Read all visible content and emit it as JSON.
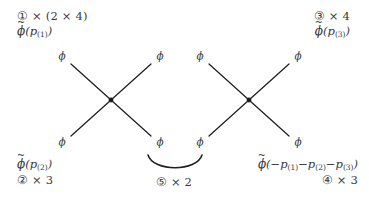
{
  "figure": {
    "background_color": "#ffffff",
    "ink_color": "#2b2b2b",
    "line_color": "#1e1e1e"
  },
  "annotations": {
    "top_left": {
      "factor": "① × (2 × 4)",
      "field_phi": "ϕ",
      "field_tilde": "~",
      "field_arg_open": "(",
      "field_momentum": "p",
      "field_subscript": "(1)",
      "field_arg_close": ")"
    },
    "top_right": {
      "factor": "③ × 4",
      "field_phi": "ϕ",
      "field_tilde": "~",
      "field_arg_open": "(",
      "field_momentum": "p",
      "field_subscript": "(3)",
      "field_arg_close": ")"
    },
    "bottom_left": {
      "factor": "② × 3",
      "field_phi": "ϕ",
      "field_tilde": "~",
      "field_arg_open": "(",
      "field_momentum": "p",
      "field_subscript": "(2)",
      "field_arg_close": ")"
    },
    "bottom_right": {
      "factor": "④ × 3",
      "field_phi": "ϕ",
      "field_tilde": "~",
      "field_arg_open": "(",
      "field_argument": "−p",
      "field_sub_1": "(1)",
      "field_op_1": "−",
      "field_mom_2": "p",
      "field_sub_2": "(2)",
      "field_op_2": "−",
      "field_mom_3": "p",
      "field_sub_3": "(3)",
      "field_arg_close": ")"
    },
    "center": {
      "factor": "⑤ × 2",
      "arc_name": "contraction-arc"
    }
  },
  "diagrams": [
    {
      "name": "left-vertex",
      "leg_labels": [
        "ϕ",
        "ϕ",
        "ϕ",
        "ϕ"
      ],
      "vertex_marker": "dot",
      "leg_count": 4
    },
    {
      "name": "right-vertex",
      "leg_labels": [
        "ϕ",
        "ϕ",
        "ϕ",
        "ϕ"
      ],
      "vertex_marker": "dot",
      "leg_count": 4
    }
  ]
}
